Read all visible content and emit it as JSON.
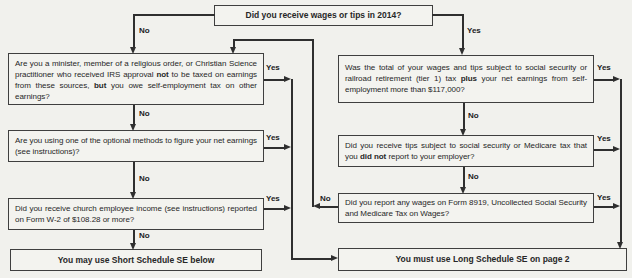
{
  "flowchart": {
    "top_question": "Did you receive wages or tips in 2014?",
    "labels": {
      "yes": "Yes",
      "no": "No"
    },
    "left": {
      "q1": {
        "seg0": "Are you a minister, member of a religious order, or Christian Science practitioner who received IRS approval ",
        "bold1": "not",
        "seg2": " to be taxed on earnings from these sources, ",
        "bold3": "but",
        "seg4": " you owe self-employment tax on other earnings?"
      },
      "q2": {
        "text": "Are you using one of the optional methods to figure your net earnings (see instructions)?"
      },
      "q3": {
        "text": "Did you receive church employee income (see instructions) reported on Form W-2 of $108.28 or more?"
      },
      "result": "You may use Short Schedule SE below"
    },
    "right": {
      "q1": {
        "seg0": "Was the total of your wages and tips subject to social security or railroad retirement (tier 1) tax ",
        "bold1": "plus",
        "seg2": " your net earnings from self-employment more than $117,000?"
      },
      "q2": {
        "seg0": "Did you receive tips subject to social security or Medicare tax that you ",
        "bold1": "did not",
        "seg2": " report to your employer?"
      },
      "q3": {
        "text": "Did you report any wages on Form 8919, Uncollected Social Security and Medicare Tax on Wages?"
      },
      "result": "You must use Long Schedule SE on page 2"
    },
    "colors": {
      "background": "#f1f1ed",
      "box_border": "#3f3f3f",
      "line": "#2f2f2f",
      "text": "#272727"
    }
  }
}
